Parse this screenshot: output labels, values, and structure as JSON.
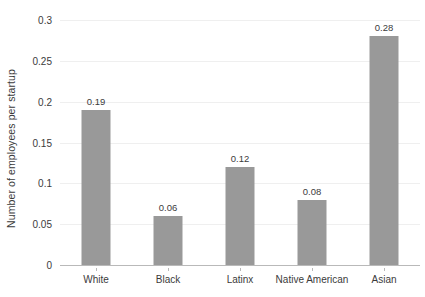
{
  "chart_data": {
    "type": "bar",
    "title": "",
    "xlabel": "",
    "ylabel": "Number of employees per startup",
    "categories": [
      "White",
      "Black",
      "Latinx",
      "Native American",
      "Asian"
    ],
    "values": [
      0.19,
      0.06,
      0.12,
      0.08,
      0.28
    ],
    "value_labels": [
      "0.19",
      "0.06",
      "0.12",
      "0.08",
      "0.28"
    ],
    "ylim": [
      0,
      0.3
    ],
    "yticks": [
      0,
      0.05,
      0.1,
      0.15,
      0.2,
      0.25,
      0.3
    ],
    "ytick_labels": [
      "0",
      "0.05",
      "0.1",
      "0.15",
      "0.2",
      "0.25",
      "0.3"
    ],
    "grid": true,
    "legend": "none",
    "bar_color": "#999999",
    "gridline_color": "#efefef",
    "axis_color": "#b9b9b9",
    "text_color": "#3b3b3b",
    "background_color": "#ffffff"
  }
}
